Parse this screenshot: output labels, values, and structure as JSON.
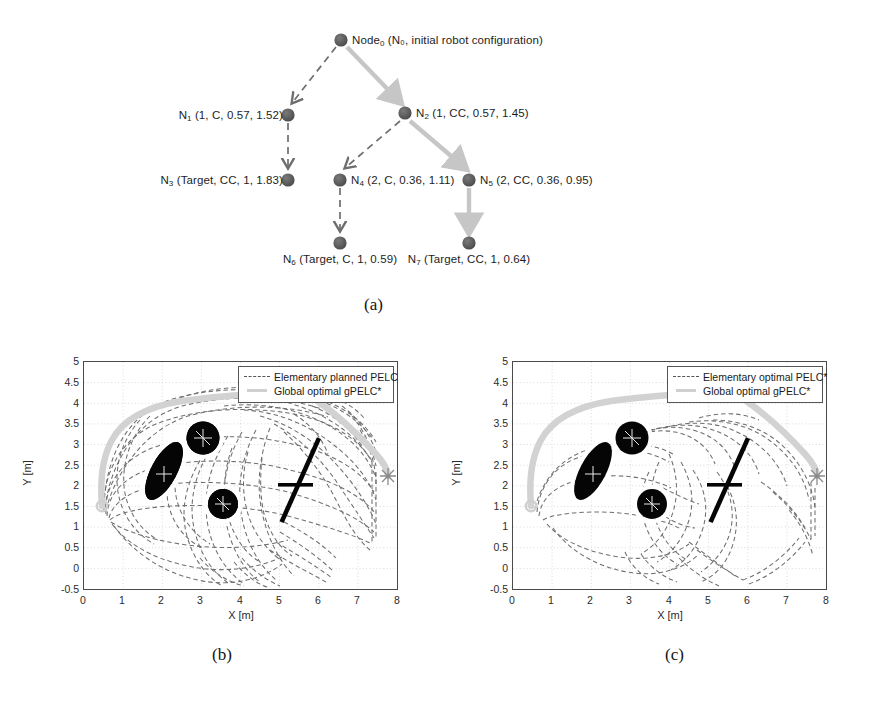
{
  "figure": {
    "subcaptions": [
      "(a)",
      "(b)",
      "(c)"
    ]
  },
  "tree": {
    "nodes": [
      {
        "id": "n0",
        "label_main": "Node",
        "label_sub": "0",
        "label_rest": " (N₀, initial robot configuration)",
        "x": 341,
        "y": 40,
        "label_x": 352,
        "label_y": 35,
        "anchor": "left"
      },
      {
        "id": "n1",
        "label_main": "N",
        "label_sub": "1",
        "label_rest": " (1, C, 0.57, 1.52)",
        "x": 288,
        "y": 115,
        "label_x": 283,
        "label_y": 110,
        "anchor": "right"
      },
      {
        "id": "n2",
        "label_main": "N",
        "label_sub": "2",
        "label_rest": " (1, CC, 0.57, 1.45)",
        "x": 405,
        "y": 113,
        "label_x": 416,
        "label_y": 108,
        "anchor": "left"
      },
      {
        "id": "n3",
        "label_main": "N",
        "label_sub": "3",
        "label_rest": " (Target, CC, 1, 1.83)",
        "x": 288,
        "y": 180,
        "label_x": 283,
        "label_y": 175,
        "anchor": "right"
      },
      {
        "id": "n4",
        "label_main": "N",
        "label_sub": "4",
        "label_rest": " (2, C, 0.36, 1.11)",
        "x": 340,
        "y": 180,
        "label_x": 351,
        "label_y": 175,
        "anchor": "left"
      },
      {
        "id": "n5",
        "label_main": "N",
        "label_sub": "5",
        "label_rest": " (2, CC, 0.36, 0.95)",
        "x": 469,
        "y": 180,
        "label_x": 480,
        "label_y": 175,
        "anchor": "left"
      },
      {
        "id": "n6",
        "label_main": "N",
        "label_sub": "6",
        "label_rest": " (Target, C, 1, 0.59)",
        "x": 340,
        "y": 243,
        "label_x": 340,
        "label_y": 254,
        "anchor": "center"
      },
      {
        "id": "n7",
        "label_main": "N",
        "label_sub": "7",
        "label_rest": " (Target, CC, 1, 0.64)",
        "x": 469,
        "y": 243,
        "label_x": 469,
        "label_y": 254,
        "anchor": "center"
      }
    ],
    "edges": [
      {
        "from": "n0",
        "to": "n1",
        "style": "dashed"
      },
      {
        "from": "n0",
        "to": "n2",
        "style": "solid-gray"
      },
      {
        "from": "n1",
        "to": "n3",
        "style": "dashed"
      },
      {
        "from": "n2",
        "to": "n4",
        "style": "dashed"
      },
      {
        "from": "n2",
        "to": "n5",
        "style": "solid-gray"
      },
      {
        "from": "n4",
        "to": "n6",
        "style": "dashed"
      },
      {
        "from": "n5",
        "to": "n7",
        "style": "solid-gray"
      }
    ],
    "colors": {
      "node": "#5a5a5a",
      "dashed_edge": "#6e6e6e",
      "solid_edge": "#c6c6c6"
    }
  },
  "plots": [
    {
      "id": "plot-b",
      "xlabel": "X [m]",
      "ylabel": "Y [m]",
      "xticks": [
        "0",
        "1",
        "2",
        "3",
        "4",
        "5",
        "6",
        "7",
        "8"
      ],
      "yticks": [
        "5",
        "4.5",
        "4",
        "3.5",
        "3",
        "2.5",
        "2",
        "1.5",
        "1",
        "0.5",
        "0",
        "-0.5"
      ],
      "xlim": [
        0,
        8
      ],
      "ylim": [
        -0.5,
        5
      ],
      "legend": [
        {
          "label": "Elementary planned PELC",
          "style": "dashed"
        },
        {
          "label": "Global optimal gPELC*",
          "style": "solid"
        }
      ]
    },
    {
      "id": "plot-c",
      "xlabel": "X [m]",
      "ylabel": "Y [m]",
      "xticks": [
        "0",
        "1",
        "2",
        "3",
        "4",
        "5",
        "6",
        "7",
        "8"
      ],
      "yticks": [
        "5",
        "4.5",
        "4",
        "3.5",
        "3",
        "2.5",
        "2",
        "1.5",
        "1",
        "0.5",
        "0",
        "-0.5"
      ],
      "xlim": [
        0,
        8
      ],
      "ylim": [
        -0.5,
        5
      ],
      "legend": [
        {
          "label": "Elementary optimal PELC*",
          "style": "dashed"
        },
        {
          "label": "Global optimal gPELC*",
          "style": "solid"
        }
      ]
    }
  ],
  "chart_data": [
    {
      "type": "scatter",
      "id": "plot-b",
      "title": "",
      "xlabel": "X [m]",
      "ylabel": "Y [m]",
      "xlim": [
        0,
        8
      ],
      "ylim": [
        -0.5,
        5
      ],
      "xticks": [
        0,
        1,
        2,
        3,
        4,
        5,
        6,
        7,
        8
      ],
      "yticks": [
        -0.5,
        0,
        0.5,
        1,
        1.5,
        2,
        2.5,
        3,
        3.5,
        4,
        4.5,
        5
      ],
      "grid": true,
      "legend_position": "top-right",
      "legend": [
        "Elementary planned PELC",
        "Global optimal gPELC*"
      ],
      "obstacles": [
        {
          "shape": "ellipse",
          "cx": 2.05,
          "cy": 2.35,
          "rx": 0.33,
          "ry": 0.82,
          "rotation_deg": -28,
          "fill": "#000000"
        },
        {
          "shape": "circle",
          "cx": 3.05,
          "cy": 3.15,
          "r": 0.42,
          "fill": "#000000"
        },
        {
          "shape": "circle",
          "cx": 3.55,
          "cy": 1.55,
          "r": 0.38,
          "fill": "#000000"
        },
        {
          "shape": "bar",
          "x1": 5.55,
          "y1": 3.25,
          "x2": 4.55,
          "y2": 1.05,
          "width": 0.1,
          "fill": "#000000"
        },
        {
          "shape": "bar",
          "x1": 4.95,
          "y1": 2.05,
          "x2": 5.85,
          "y2": 2.0,
          "width": 0.08,
          "fill": "#000000"
        }
      ],
      "start_point": [
        0.45,
        1.5
      ],
      "goal_point": [
        7.05,
        2.05
      ],
      "global_path": [
        [
          0.45,
          1.5
        ],
        [
          0.48,
          1.95
        ],
        [
          0.6,
          2.6
        ],
        [
          0.8,
          3.1
        ],
        [
          1.15,
          3.45
        ],
        [
          1.6,
          3.6
        ],
        [
          2.2,
          3.72
        ],
        [
          2.9,
          3.85
        ],
        [
          3.5,
          3.95
        ],
        [
          3.95,
          3.95
        ],
        [
          4.5,
          3.72
        ],
        [
          5.1,
          3.35
        ],
        [
          5.75,
          2.95
        ],
        [
          6.4,
          2.55
        ],
        [
          6.9,
          2.2
        ],
        [
          7.05,
          2.05
        ]
      ],
      "series": [
        {
          "name": "Elementary planned PELC",
          "style": "dashed",
          "color": "#707070",
          "description": "dense fan of dashed elementary PELC curves spanning x 0.5-7.2, y -0.45-4.6"
        },
        {
          "name": "Global optimal gPELC*",
          "style": "solid",
          "color": "#cfcfcf",
          "description": "thick light-gray optimal path from start (0.45,1.5) over the top of obstacles to goal (7.05,2.05)"
        }
      ]
    },
    {
      "type": "scatter",
      "id": "plot-c",
      "title": "",
      "xlabel": "X [m]",
      "ylabel": "Y [m]",
      "xlim": [
        0,
        8
      ],
      "ylim": [
        -0.5,
        5
      ],
      "xticks": [
        0,
        1,
        2,
        3,
        4,
        5,
        6,
        7,
        8
      ],
      "yticks": [
        -0.5,
        0,
        0.5,
        1,
        1.5,
        2,
        2.5,
        3,
        3.5,
        4,
        4.5,
        5
      ],
      "grid": true,
      "legend_position": "top-right",
      "legend": [
        "Elementary optimal PELC*",
        "Global optimal gPELC*"
      ],
      "obstacles": [
        {
          "shape": "ellipse",
          "cx": 2.05,
          "cy": 2.35,
          "rx": 0.33,
          "ry": 0.82,
          "rotation_deg": -28,
          "fill": "#000000"
        },
        {
          "shape": "circle",
          "cx": 3.05,
          "cy": 3.15,
          "r": 0.42,
          "fill": "#000000"
        },
        {
          "shape": "circle",
          "cx": 3.55,
          "cy": 1.55,
          "r": 0.38,
          "fill": "#000000"
        },
        {
          "shape": "bar",
          "x1": 5.55,
          "y1": 3.25,
          "x2": 4.55,
          "y2": 1.05,
          "width": 0.1,
          "fill": "#000000"
        },
        {
          "shape": "bar",
          "x1": 4.95,
          "y1": 2.05,
          "x2": 5.85,
          "y2": 2.0,
          "width": 0.08,
          "fill": "#000000"
        }
      ],
      "start_point": [
        0.45,
        1.5
      ],
      "goal_point": [
        7.05,
        2.05
      ],
      "global_path": [
        [
          0.45,
          1.5
        ],
        [
          0.48,
          1.95
        ],
        [
          0.6,
          2.6
        ],
        [
          0.8,
          3.1
        ],
        [
          1.15,
          3.45
        ],
        [
          1.6,
          3.6
        ],
        [
          2.2,
          3.72
        ],
        [
          2.9,
          3.85
        ],
        [
          3.5,
          3.95
        ],
        [
          3.95,
          3.95
        ],
        [
          4.5,
          3.72
        ],
        [
          5.1,
          3.35
        ],
        [
          5.75,
          2.95
        ],
        [
          6.4,
          2.55
        ],
        [
          6.9,
          2.2
        ],
        [
          7.05,
          2.05
        ]
      ],
      "series": [
        {
          "name": "Elementary optimal PELC*",
          "style": "dashed",
          "color": "#707070",
          "description": "sparser set of dashed optimal PELC* curves, mostly a single envelope around the obstacle field"
        },
        {
          "name": "Global optimal gPELC*",
          "style": "solid",
          "color": "#cfcfcf",
          "description": "thick light-gray optimal path from start (0.45,1.5) over the top of obstacles to goal (7.05,2.05)"
        }
      ]
    }
  ]
}
